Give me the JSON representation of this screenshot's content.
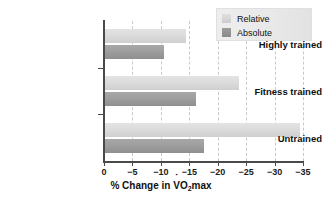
{
  "chart_data": {
    "type": "bar",
    "orientation": "horizontal",
    "title": "",
    "xlabel_parts": {
      "prefix": "% Change in ",
      "v": "V",
      "o": "O",
      "sub": "2",
      "suffix": "max"
    },
    "xlabel": "% Change in VO2max",
    "ylabel": "",
    "categories": [
      "Highly trained",
      "Fitness trained",
      "Untrained"
    ],
    "series": [
      {
        "name": "Relative",
        "values": [
          -14.5,
          -23.8,
          -34.5
        ],
        "color": "#dcdcdc"
      },
      {
        "name": "Absolute",
        "values": [
          -10.5,
          -16.2,
          -17.6
        ],
        "color": "#9e9e9e"
      }
    ],
    "xlim": [
      0,
      -35
    ],
    "xticks": [
      0,
      -5,
      -10,
      -15,
      -20,
      -25,
      -30,
      -35
    ],
    "xticklabels": [
      "0",
      "−5",
      "−10",
      "−15",
      "−20",
      "−25",
      "−30",
      "−35"
    ],
    "grid": "vertical-dashed",
    "legend_position": "top-right",
    "legend_entries": [
      "Relative",
      "Absolute"
    ]
  }
}
